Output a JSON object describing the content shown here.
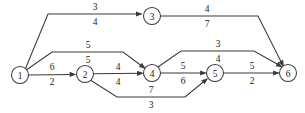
{
  "diagram": {
    "type": "directed-network-graph",
    "title": "",
    "width": 305,
    "height": 113,
    "stroke_color": "#3a3a3a",
    "text_color": "#1a1a1a",
    "background_color": "#ffffff",
    "nodes": [
      {
        "id": "1",
        "label": "1",
        "cx": 20,
        "cy": 75,
        "r": 8.5
      },
      {
        "id": "2",
        "label": "2",
        "cx": 85,
        "cy": 74,
        "r": 8.5
      },
      {
        "id": "3",
        "label": "3",
        "cx": 152,
        "cy": 16,
        "r": 8.5
      },
      {
        "id": "4",
        "label": "4",
        "cx": 152,
        "cy": 73,
        "r": 8.5
      },
      {
        "id": "5",
        "label": "5",
        "cx": 215,
        "cy": 73,
        "r": 8.5
      },
      {
        "id": "6",
        "label": "6",
        "cx": 288,
        "cy": 73,
        "r": 8.5
      }
    ],
    "edges": [
      {
        "id": "e13",
        "from": "1",
        "to": "3",
        "upper_label": "3",
        "lower_label": "4",
        "path": "M 25.5 68.5 L 48 14 L 141.5 14",
        "arrow": {
          "x": 142.5,
          "y": 14,
          "angle": 0
        },
        "upper_label_pos": {
          "x": 95,
          "y": 7
        },
        "lower_label_pos": {
          "x": 95,
          "y": 22
        }
      },
      {
        "id": "e36",
        "from": "3",
        "to": "6",
        "upper_label": "4",
        "lower_label": "7",
        "path": "M 161 16 L 258 16 L 283 65.5",
        "arrow": {
          "x": 283.8,
          "y": 66.8,
          "angle": 63
        },
        "upper_label_pos": {
          "x": 207,
          "y": 9
        },
        "lower_label_pos": {
          "x": 207,
          "y": 24
        }
      },
      {
        "id": "e14",
        "from": "1",
        "to": "4",
        "upper_label": "5",
        "lower_label": "5",
        "path": "M 27 69.5 L 52 52 L 123 52 L 144.5 68",
        "arrow": {
          "x": 145.6,
          "y": 68.8,
          "angle": 37
        },
        "upper_label_pos": {
          "x": 88,
          "y": 45
        },
        "lower_label_pos": {
          "x": 88,
          "y": 60
        }
      },
      {
        "id": "e12",
        "from": "1",
        "to": "2",
        "upper_label": "6",
        "lower_label": "2",
        "path": "M 28.5 75 L 75 74.4",
        "arrow": {
          "x": 76.2,
          "y": 74.4,
          "angle": 0
        },
        "upper_label_pos": {
          "x": 52,
          "y": 67
        },
        "lower_label_pos": {
          "x": 52,
          "y": 82
        }
      },
      {
        "id": "e24",
        "from": "2",
        "to": "4",
        "upper_label": "4",
        "lower_label": "4",
        "path": "M 93.5 73.8 L 142.5 73.3",
        "arrow": {
          "x": 143.6,
          "y": 73.3,
          "angle": 0
        },
        "upper_label_pos": {
          "x": 118,
          "y": 67
        },
        "lower_label_pos": {
          "x": 118,
          "y": 82
        }
      },
      {
        "id": "e25",
        "from": "2",
        "to": "5",
        "upper_label": "7",
        "lower_label": "3",
        "path": "M 91 80.5 L 117 97 L 185 97 L 207 79",
        "arrow": {
          "x": 208,
          "y": 78.2,
          "angle": -39
        },
        "upper_label_pos": {
          "x": 151,
          "y": 90
        },
        "lower_label_pos": {
          "x": 151,
          "y": 105
        }
      },
      {
        "id": "e45",
        "from": "4",
        "to": "5",
        "upper_label": "5",
        "lower_label": "6",
        "path": "M 160.5 73 L 205.5 73",
        "arrow": {
          "x": 206.6,
          "y": 73,
          "angle": 0
        },
        "upper_label_pos": {
          "x": 183,
          "y": 66
        },
        "lower_label_pos": {
          "x": 183,
          "y": 81
        }
      },
      {
        "id": "e46",
        "from": "4",
        "to": "6",
        "upper_label": "3",
        "lower_label": "4",
        "path": "M 158 67 L 181 51 L 254 51 L 281.5 66.5",
        "arrow": {
          "x": 282.6,
          "y": 67.2,
          "angle": 29
        },
        "upper_label_pos": {
          "x": 218,
          "y": 44
        },
        "lower_label_pos": {
          "x": 218,
          "y": 59
        }
      },
      {
        "id": "e56",
        "from": "5",
        "to": "6",
        "upper_label": "5",
        "lower_label": "2",
        "path": "M 223.5 73 L 278.5 73",
        "arrow": {
          "x": 279.6,
          "y": 73,
          "angle": 0
        },
        "upper_label_pos": {
          "x": 252,
          "y": 66
        },
        "lower_label_pos": {
          "x": 252,
          "y": 81
        }
      }
    ]
  }
}
